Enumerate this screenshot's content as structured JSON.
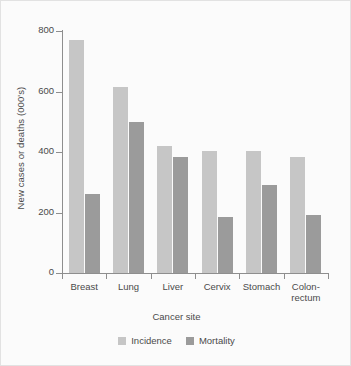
{
  "chart_data": {
    "type": "bar",
    "title": "",
    "xlabel": "Cancer site",
    "ylabel": "New cases or deaths (000's)",
    "categories": [
      "Breast",
      "Lung",
      "Liver",
      "Cervix",
      "Stomach",
      "Colon-\nrectum"
    ],
    "category_labels": [
      {
        "line1": "Breast",
        "line2": ""
      },
      {
        "line1": "Lung",
        "line2": ""
      },
      {
        "line1": "Liver",
        "line2": ""
      },
      {
        "line1": "Cervix",
        "line2": ""
      },
      {
        "line1": "Stomach",
        "line2": ""
      },
      {
        "line1": "Colon-",
        "line2": "rectum"
      }
    ],
    "series": [
      {
        "name": "Incidence",
        "color": "#c6c6c6",
        "values": [
          770,
          615,
          420,
          405,
          405,
          385
        ]
      },
      {
        "name": "Mortality",
        "color": "#9b9b9b",
        "values": [
          260,
          500,
          385,
          185,
          290,
          192
        ]
      }
    ],
    "ylim": [
      0,
      800
    ],
    "yticks": [
      0,
      200,
      400,
      600,
      800
    ],
    "ytick_labels": [
      "0",
      "200",
      "400",
      "600",
      "800"
    ],
    "grid": false,
    "legend_position": "bottom"
  },
  "legend": {
    "items": [
      {
        "label": "Incidence"
      },
      {
        "label": "Mortality"
      }
    ]
  }
}
